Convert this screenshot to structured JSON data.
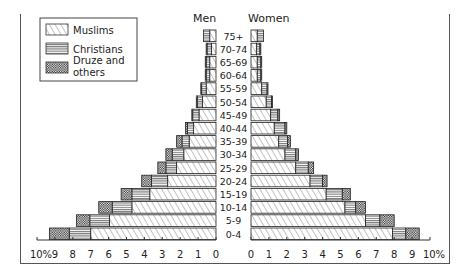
{
  "chart_data": {
    "type": "bar",
    "subtype": "population-pyramid",
    "title": "",
    "side_labels": {
      "left": "Men",
      "right": "Women"
    },
    "legend": {
      "placement": "top-left",
      "entries": [
        {
          "name": "Muslims",
          "pattern": "diagonal-hatch"
        },
        {
          "name": "Christians",
          "pattern": "horizontal-lines"
        },
        {
          "name": "Druze and others",
          "pattern": "dotted"
        }
      ]
    },
    "categories": [
      "75+",
      "70-74",
      "65-69",
      "60-64",
      "55-59",
      "50-54",
      "45-49",
      "40-44",
      "35-39",
      "30-34",
      "25-29",
      "20-24",
      "15-19",
      "10-14",
      "5-9",
      "0-4"
    ],
    "xlabel_left_ticks": [
      "10%",
      "9",
      "8",
      "7",
      "6",
      "5",
      "4",
      "3",
      "2",
      "1",
      "0"
    ],
    "xlabel_right_ticks": [
      "0",
      "1",
      "2",
      "3",
      "4",
      "5",
      "6",
      "7",
      "8",
      "9",
      "10%"
    ],
    "xlim": [
      0,
      10
    ],
    "unit": "%",
    "series": {
      "men": [
        {
          "name": "Muslims",
          "values": [
            0.35,
            0.25,
            0.35,
            0.35,
            0.55,
            0.75,
            0.95,
            1.25,
            1.5,
            1.8,
            2.2,
            2.7,
            3.7,
            4.7,
            5.95,
            7.0
          ]
        },
        {
          "name": "Christians",
          "values": [
            0.35,
            0.25,
            0.2,
            0.2,
            0.25,
            0.3,
            0.35,
            0.35,
            0.4,
            0.65,
            0.6,
            0.9,
            1.0,
            1.1,
            1.1,
            1.2
          ]
        },
        {
          "name": "Druze and others",
          "values": [
            0.0,
            0.05,
            0.05,
            0.05,
            0.05,
            0.05,
            0.05,
            0.1,
            0.3,
            0.35,
            0.45,
            0.55,
            0.6,
            0.75,
            0.75,
            1.1
          ]
        }
      ],
      "women": [
        {
          "name": "Muslims",
          "values": [
            0.35,
            0.3,
            0.35,
            0.35,
            0.6,
            0.85,
            1.1,
            1.3,
            1.55,
            1.9,
            2.5,
            3.3,
            4.2,
            5.25,
            6.4,
            7.9
          ]
        },
        {
          "name": "Christians",
          "values": [
            0.35,
            0.2,
            0.2,
            0.2,
            0.3,
            0.3,
            0.4,
            0.6,
            0.5,
            0.6,
            0.7,
            0.7,
            0.9,
            0.6,
            0.8,
            0.75
          ]
        },
        {
          "name": "Druze and others",
          "values": [
            0.0,
            0.05,
            0.05,
            0.05,
            0.05,
            0.05,
            0.1,
            0.1,
            0.15,
            0.15,
            0.3,
            0.25,
            0.45,
            0.55,
            0.8,
            0.75
          ]
        }
      ]
    }
  }
}
